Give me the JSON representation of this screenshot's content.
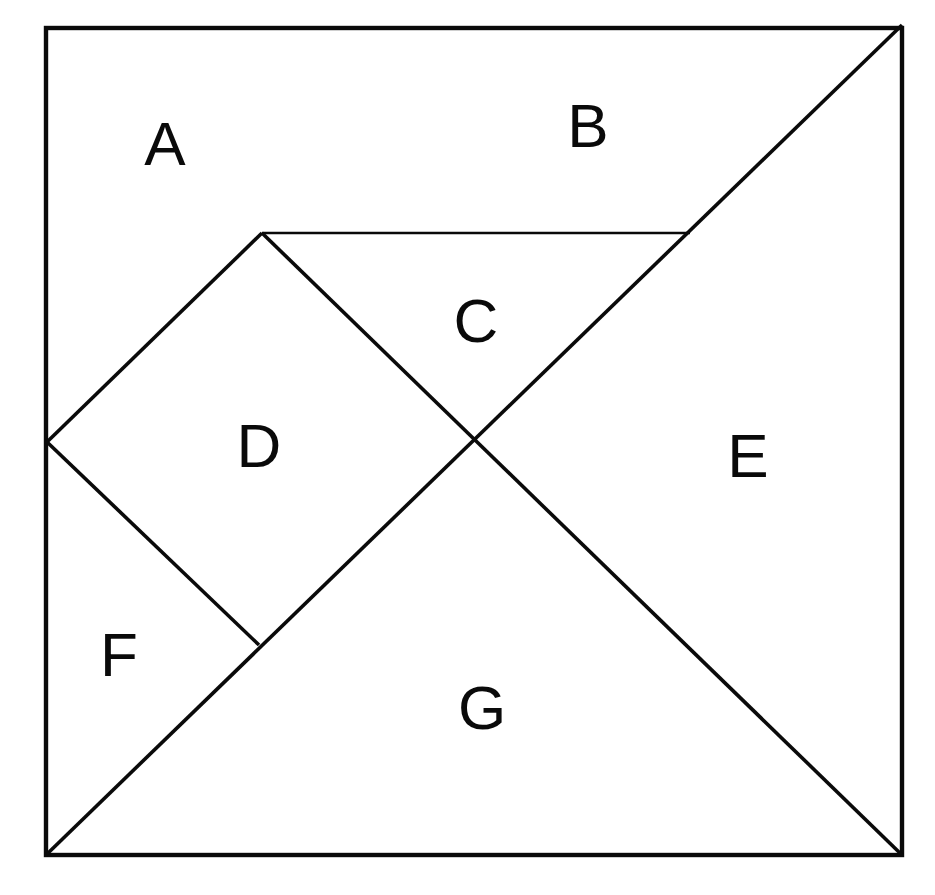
{
  "figure": {
    "type": "geometric-dissection-diagram",
    "background_color": "#ffffff",
    "line_color": "#0a0a0a",
    "label_color": "#0a0a0a"
  },
  "canvas": {
    "width": 935,
    "height": 895
  },
  "square": {
    "name": "outer-square",
    "left": 46,
    "top": 28,
    "right": 902,
    "bottom": 855,
    "stroke_width": 4.4
  },
  "vertices": {
    "top_left": [
      46,
      28
    ],
    "top_right": [
      902,
      25
    ],
    "bottom_left": [
      46,
      855
    ],
    "bottom_right": [
      902,
      855
    ],
    "left_mid": [
      47,
      442
    ],
    "top_junction": [
      262,
      233
    ],
    "center": [
      475,
      440
    ],
    "right_diag_mid": [
      690,
      233
    ],
    "lower_junction": [
      259,
      645
    ]
  },
  "lines": [
    {
      "name": "main-diagonal",
      "from": [
        46,
        855
      ],
      "to": [
        902,
        25
      ],
      "weight": "medium"
    },
    {
      "name": "left-upper-diagonal",
      "from": [
        47,
        442
      ],
      "to": [
        262,
        233
      ],
      "weight": "medium"
    },
    {
      "name": "horizontal-divider",
      "from": [
        262,
        233
      ],
      "to": [
        690,
        233
      ],
      "weight": "thin"
    },
    {
      "name": "c-diagonal",
      "from": [
        262,
        233
      ],
      "to": [
        475,
        440
      ],
      "weight": "medium"
    },
    {
      "name": "center-to-bottom-right",
      "from": [
        475,
        440
      ],
      "to": [
        902,
        855
      ],
      "weight": "medium"
    },
    {
      "name": "left-lower-diagonal",
      "from": [
        47,
        442
      ],
      "to": [
        259,
        645
      ],
      "weight": "medium"
    }
  ],
  "pieces": [
    {
      "id": "A",
      "label": "A",
      "shape": "large-triangle",
      "label_x": 165,
      "label_y": 143,
      "polygon": "46,28 262,233 47,442"
    },
    {
      "id": "B",
      "label": "B",
      "shape": "large-triangle",
      "label_x": 588,
      "label_y": 125,
      "polygon": "262,233 902,25 690,233"
    },
    {
      "id": "C",
      "label": "C",
      "shape": "medium-triangle",
      "label_x": 476,
      "label_y": 320,
      "polygon": "262,233 690,233 475,440"
    },
    {
      "id": "D",
      "label": "D",
      "shape": "square",
      "label_x": 259,
      "label_y": 445,
      "polygon": "262,233 475,440 259,645 47,442"
    },
    {
      "id": "E",
      "label": "E",
      "shape": "large-triangle",
      "label_x": 748,
      "label_y": 455,
      "polygon": "690,233 902,25 902,855 475,440"
    },
    {
      "id": "F",
      "label": "F",
      "shape": "small-triangle",
      "label_x": 119,
      "label_y": 654,
      "polygon": "47,442 259,645 46,855"
    },
    {
      "id": "G",
      "label": "G",
      "shape": "large-triangle",
      "label_x": 482,
      "label_y": 707,
      "polygon": "46,855 475,440 902,855"
    }
  ]
}
